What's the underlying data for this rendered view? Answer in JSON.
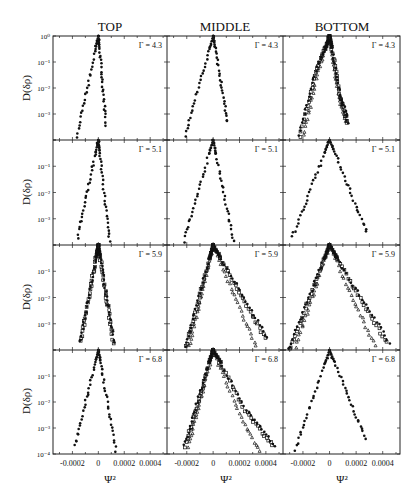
{
  "chart_data": {
    "type": "scatter",
    "layout": "grid 4 rows x 3 columns, shared axes",
    "column_titles": [
      "TOP",
      "MIDDLE",
      "BOTTOM"
    ],
    "row_params": [
      "Γ = 4.3",
      "Γ = 5.1",
      "Γ = 5.9",
      "Γ = 6.8"
    ],
    "ylabel": "D(δρ)",
    "xlabel": "Ψ²",
    "yscale": "log",
    "ylim": [
      0.0001,
      1
    ],
    "xlim": [
      -0.00035,
      0.00053
    ],
    "y_ticks": [
      "10⁰",
      "10⁻¹",
      "10⁻²",
      "10⁻³",
      "10⁻⁴"
    ],
    "x_ticks": [
      "-0.0002",
      "0",
      "0.0002",
      "0.0004"
    ],
    "x_tick_values": [
      -0.0002,
      0,
      0.0002,
      0.0004
    ],
    "grid": false,
    "marker_legend": {
      "filled_circle": "series 1",
      "open_square": "series 2",
      "open_triangle": "series 3"
    },
    "panels": [
      {
        "row": 0,
        "col": 0,
        "gamma": "Γ = 4.3",
        "shape": "narrow symmetric peak",
        "left": {
          "x_end": -0.00017,
          "y_end": 0.0001,
          "bump": [
            -0.00012,
            0.0012
          ]
        },
        "right": {
          "x_end": 6e-05,
          "y_end": 0.0004
        },
        "series": [
          "filled"
        ]
      },
      {
        "row": 0,
        "col": 1,
        "gamma": "Γ = 4.3",
        "shape": "symmetric peak",
        "left": {
          "x_end": -0.00022,
          "y_end": 0.0001
        },
        "right": {
          "x_end": 0.00011,
          "y_end": 0.0005
        },
        "series": [
          "filled"
        ]
      },
      {
        "row": 0,
        "col": 2,
        "gamma": "Γ = 4.3",
        "shape": "broad peak with shoulders, multiple series",
        "left": {
          "x_end": -0.00024,
          "y_end": 0.0001,
          "shoulder": [
            -0.0001,
            0.05
          ]
        },
        "right": {
          "x_end": 0.00014,
          "y_end": 0.0005,
          "shoulder": [
            8e-05,
            0.006
          ]
        },
        "series": [
          "filled",
          "open_square",
          "open_triangle"
        ]
      },
      {
        "row": 1,
        "col": 0,
        "gamma": "Γ = 5.1",
        "shape": "narrow symmetric peak",
        "left": {
          "x_end": -0.00016,
          "y_end": 0.0002
        },
        "right": {
          "x_end": 9e-05,
          "y_end": 0.0001
        },
        "series": [
          "filled"
        ]
      },
      {
        "row": 1,
        "col": 1,
        "gamma": "Γ = 5.1",
        "shape": "symmetric peak",
        "left": {
          "x_end": -0.00023,
          "y_end": 0.0001
        },
        "right": {
          "x_end": 0.00016,
          "y_end": 0.0001
        },
        "series": [
          "filled"
        ]
      },
      {
        "row": 1,
        "col": 2,
        "gamma": "Γ = 5.1",
        "shape": "broad symmetric peak",
        "left": {
          "x_end": -0.00028,
          "y_end": 0.0002
        },
        "right": {
          "x_end": 0.00028,
          "y_end": 0.0003
        },
        "series": [
          "filled"
        ]
      },
      {
        "row": 2,
        "col": 0,
        "gamma": "Γ = 5.9",
        "shape": "narrow symmetric peak",
        "left": {
          "x_end": -0.00014,
          "y_end": 0.0002
        },
        "right": {
          "x_end": 0.00012,
          "y_end": 0.0002
        },
        "series": [
          "filled",
          "open_square"
        ]
      },
      {
        "row": 2,
        "col": 1,
        "gamma": "Γ = 5.9",
        "shape": "asymmetric peak, long right tail",
        "left": {
          "x_end": -0.00022,
          "y_end": 0.0001
        },
        "right": {
          "x_end": 0.00041,
          "y_end": 0.0003,
          "plateau": [
            0.00015,
            0.05
          ]
        },
        "series": [
          "filled",
          "open_square",
          "open_triangle"
        ]
      },
      {
        "row": 2,
        "col": 2,
        "gamma": "Γ = 5.9",
        "shape": "asymmetric peak, long right tail",
        "left": {
          "x_end": -0.00031,
          "y_end": 0.0001
        },
        "right": {
          "x_end": 0.00045,
          "y_end": 0.0002,
          "plateau": [
            0.00016,
            0.04
          ]
        },
        "series": [
          "filled",
          "open_square",
          "open_triangle"
        ]
      },
      {
        "row": 3,
        "col": 0,
        "gamma": "Γ = 6.8",
        "shape": "narrow symmetric peak",
        "left": {
          "x_end": -0.00018,
          "y_end": 0.0002
        },
        "right": {
          "x_end": 0.00014,
          "y_end": 0.0001
        },
        "series": [
          "filled"
        ]
      },
      {
        "row": 3,
        "col": 1,
        "gamma": "Γ = 6.8",
        "shape": "asymmetric peak, long right tail",
        "left": {
          "x_end": -0.00022,
          "y_end": 0.0002
        },
        "right": {
          "x_end": 0.00047,
          "y_end": 0.0002,
          "plateau": [
            0.00025,
            0.005
          ]
        },
        "series": [
          "filled",
          "open_square",
          "open_triangle"
        ]
      },
      {
        "row": 3,
        "col": 2,
        "gamma": "Γ = 6.8",
        "shape": "broad symmetric peak",
        "left": {
          "x_end": -0.00027,
          "y_end": 0.0001
        },
        "right": {
          "x_end": 0.00027,
          "y_end": 0.0004
        },
        "series": [
          "filled"
        ]
      }
    ]
  }
}
